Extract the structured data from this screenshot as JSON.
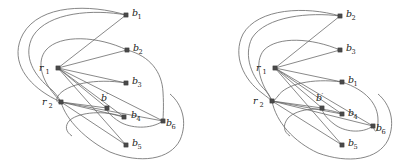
{
  "figure": {
    "type": "graph-diagram-pair",
    "background_color": "#ffffff",
    "node_color": "#4a4a4a",
    "edge_color": "#6b6b6b",
    "curve_color": "#707070"
  },
  "panels": [
    {
      "id": "left",
      "name": "left-graph",
      "nodes": [
        {
          "id": "r1",
          "label": "r",
          "sub": "1",
          "prime": "",
          "x": 58,
          "y": 68,
          "label_x": 39,
          "label_y": 71,
          "sub_dx": 6.4,
          "sub_dy": 2.6
        },
        {
          "id": "r2",
          "label": "r",
          "sub": "2",
          "prime": "",
          "x": 61,
          "y": 102,
          "label_x": 42,
          "label_y": 105,
          "sub_dx": 6.4,
          "sub_dy": 2.6
        },
        {
          "id": "b1",
          "label": "b",
          "sub": "1",
          "prime": "",
          "x": 126,
          "y": 15,
          "label_x": 132,
          "label_y": 16,
          "sub_dx": 5.6,
          "sub_dy": 2.6
        },
        {
          "id": "b2",
          "label": "b",
          "sub": "2",
          "prime": "",
          "x": 127,
          "y": 50,
          "label_x": 133,
          "label_y": 51,
          "sub_dx": 5.6,
          "sub_dy": 2.6
        },
        {
          "id": "b3",
          "label": "b",
          "sub": "3",
          "prime": "",
          "x": 126,
          "y": 83,
          "label_x": 132,
          "label_y": 84,
          "sub_dx": 5.6,
          "sub_dy": 2.6
        },
        {
          "id": "bp",
          "label": "b",
          "sub": "",
          "prime": "′",
          "x": 107,
          "y": 108,
          "label_x": 101,
          "label_y": 101,
          "sub_dx": 0,
          "sub_dy": 0
        },
        {
          "id": "b4",
          "label": "b",
          "sub": "4",
          "prime": "",
          "x": 124,
          "y": 117,
          "label_x": 131,
          "label_y": 118,
          "sub_dx": 5.6,
          "sub_dy": 2.6
        },
        {
          "id": "b5",
          "label": "b",
          "sub": "5",
          "prime": "",
          "x": 126,
          "y": 145,
          "label_x": 132,
          "label_y": 146,
          "sub_dx": 5.6,
          "sub_dy": 2.6
        },
        {
          "id": "b6",
          "label": "b",
          "sub": "6",
          "prime": "",
          "x": 163,
          "y": 121,
          "label_x": 166,
          "label_y": 126,
          "sub_dx": 5.6,
          "sub_dy": 2.6
        }
      ],
      "edges": [
        {
          "from": "r1",
          "to": "b1"
        },
        {
          "from": "r1",
          "to": "b2"
        },
        {
          "from": "r1",
          "to": "b3"
        },
        {
          "from": "r1",
          "to": "bp"
        },
        {
          "from": "r1",
          "to": "b4"
        },
        {
          "from": "r1",
          "to": "b5"
        },
        {
          "from": "r1",
          "to": "b6"
        },
        {
          "from": "r2",
          "to": "bp"
        },
        {
          "from": "r2",
          "to": "b4"
        },
        {
          "from": "r2",
          "to": "b5"
        },
        {
          "from": "r2",
          "to": "b6"
        }
      ],
      "curves": [
        "M 126 15 C 90 4 40 4 23 34 C 10 58 24 80 46 94 C 52 98 57 100 61 102",
        "M 126 15 C 94 9 48 12 33 36 C 22 56 34 76 52 90 C 56 94 59 98 61 102",
        "M 127 50 C 98 36 60 34 46 50 C 36 62 42 80 54 94 C 57 98 59 100 61 102",
        "M 127 50 C 150 56 162 72 163 92 C 164 108 163 116 163 121",
        "M 126 83 C 96 78 66 84 58 96 C 55 101 58 104 61 102",
        "M 124 117 C 104 110 80 112 70 120 C 64 126 66 132 72 136",
        "M 163 121 C 150 130 130 128 120 122 C 110 116 106 110 107 108",
        "M 61 102 C 66 120 86 140 110 152 C 140 164 170 160 180 140 C 188 122 182 104 170 94"
      ]
    },
    {
      "id": "right",
      "name": "right-graph",
      "nodes": [
        {
          "id": "r1",
          "label": "r",
          "sub": "1",
          "prime": "",
          "x": 275,
          "y": 68,
          "label_x": 256,
          "label_y": 71,
          "sub_dx": 6.4,
          "sub_dy": 2.6
        },
        {
          "id": "r2",
          "label": "r",
          "sub": "2",
          "prime": "",
          "x": 272,
          "y": 101,
          "label_x": 253,
          "label_y": 104,
          "sub_dx": 6.4,
          "sub_dy": 2.6
        },
        {
          "id": "b2",
          "label": "b",
          "sub": "2",
          "prime": "",
          "x": 340,
          "y": 16,
          "label_x": 346,
          "label_y": 17,
          "sub_dx": 5.6,
          "sub_dy": 2.6
        },
        {
          "id": "b3",
          "label": "b",
          "sub": "3",
          "prime": "",
          "x": 340,
          "y": 50,
          "label_x": 346,
          "label_y": 51,
          "sub_dx": 5.6,
          "sub_dy": 2.6
        },
        {
          "id": "b1",
          "label": "b",
          "sub": "1",
          "prime": "",
          "x": 342,
          "y": 82,
          "label_x": 348,
          "label_y": 83,
          "sub_dx": 5.6,
          "sub_dy": 2.6
        },
        {
          "id": "bp",
          "label": "b",
          "sub": "",
          "prime": "′",
          "x": 322,
          "y": 108,
          "label_x": 316,
          "label_y": 101,
          "sub_dx": 0,
          "sub_dy": 0
        },
        {
          "id": "b4",
          "label": "b",
          "sub": "4",
          "prime": "",
          "x": 342,
          "y": 114,
          "label_x": 348,
          "label_y": 116,
          "sub_dx": 5.6,
          "sub_dy": 2.6
        },
        {
          "id": "b5",
          "label": "b",
          "sub": "5",
          "prime": "",
          "x": 342,
          "y": 145,
          "label_x": 348,
          "label_y": 146,
          "sub_dx": 5.6,
          "sub_dy": 2.6
        },
        {
          "id": "b6",
          "label": "b",
          "sub": "6",
          "prime": "",
          "x": 373,
          "y": 126,
          "label_x": 376,
          "label_y": 131,
          "sub_dx": 5.6,
          "sub_dy": 2.6
        }
      ],
      "edges": [
        {
          "from": "r1",
          "to": "b2"
        },
        {
          "from": "r1",
          "to": "b3"
        },
        {
          "from": "r1",
          "to": "b1"
        },
        {
          "from": "r1",
          "to": "bp"
        },
        {
          "from": "r1",
          "to": "b4"
        },
        {
          "from": "r1",
          "to": "b5"
        },
        {
          "from": "r1",
          "to": "b6"
        },
        {
          "from": "r2",
          "to": "bp"
        },
        {
          "from": "r2",
          "to": "b4"
        },
        {
          "from": "r2",
          "to": "b5"
        },
        {
          "from": "r2",
          "to": "b6"
        }
      ],
      "curves": [
        "M 340 16 C 306 6 258 8 243 34 C 232 56 244 80 262 93 C 267 97 270 99 272 101",
        "M 340 16 C 310 12 266 16 252 38 C 243 56 252 78 266 91 C 269 95 271 99 272 101",
        "M 340 50 C 312 38 278 36 264 50 C 254 62 260 82 269 95 C 271 99 272 100 272 101",
        "M 342 82 C 366 90 378 104 378 120 C 378 130 376 136 373 126",
        "M 342 82 C 312 78 286 84 278 96 C 273 102 272 103 272 101",
        "M 342 114 C 322 106 298 108 288 118 C 282 126 284 132 290 136",
        "M 373 126 C 362 134 344 132 334 124 C 326 118 322 112 322 108",
        "M 272 101 C 276 122 294 142 318 153 C 348 164 378 160 388 140 C 396 122 390 104 378 94"
      ]
    }
  ]
}
